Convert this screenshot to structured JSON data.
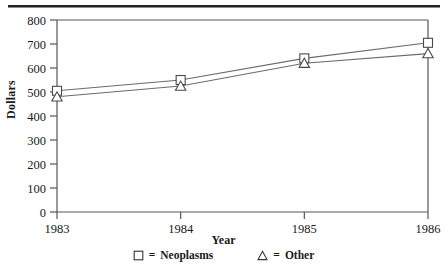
{
  "chart_data": {
    "type": "line",
    "title": "",
    "xlabel": "Year",
    "ylabel": "Dollars",
    "x": [
      1983,
      1984,
      1985,
      1986
    ],
    "categories": [
      "1983",
      "1984",
      "1985",
      "1986"
    ],
    "xlim": [
      1983,
      1986
    ],
    "ylim": [
      0,
      800
    ],
    "yticks": [
      0,
      100,
      200,
      300,
      400,
      500,
      600,
      700,
      800
    ],
    "ytick_labels": [
      "0",
      "100",
      "200",
      "300",
      "400",
      "500",
      "600",
      "700",
      "800"
    ],
    "xticks": [
      1983,
      1984,
      1985,
      1986
    ],
    "xtick_labels": [
      "1983",
      "1984",
      "1985",
      "1986"
    ],
    "grid": false,
    "legend_position": "below-plot",
    "series": [
      {
        "name": "Neoplasms",
        "marker": "open-square",
        "values": [
          505,
          550,
          640,
          705
        ]
      },
      {
        "name": "Other",
        "marker": "open-triangle",
        "values": [
          480,
          525,
          620,
          660
        ]
      }
    ]
  },
  "legend": {
    "equals": "=",
    "entries": [
      {
        "marker": "square-marker-icon",
        "label": "Neoplasms"
      },
      {
        "marker": "triangle-marker-icon",
        "label": "Other"
      }
    ]
  },
  "colors": {
    "ink": "#1a1a1a",
    "axis": "#555555",
    "line": "#6b6b6b",
    "rule": "#242424",
    "background": "#ffffff"
  }
}
